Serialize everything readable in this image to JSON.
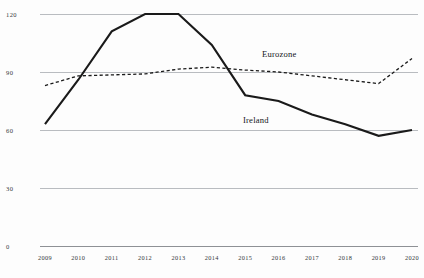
{
  "chart_data": {
    "type": "line",
    "title": "",
    "subtitle": "",
    "xlabel": "",
    "ylabel": "",
    "categories": [
      "2009",
      "2010",
      "2011",
      "2012",
      "2013",
      "2014",
      "2015",
      "2016",
      "2017",
      "2018",
      "2019",
      "2020"
    ],
    "x": [
      2009,
      2010,
      2011,
      2012,
      2013,
      2014,
      2015,
      2016,
      2017,
      2018,
      2019,
      2020
    ],
    "ylim": [
      0,
      120
    ],
    "xlim": [
      2009,
      2020
    ],
    "yticks": [
      0,
      30,
      60,
      90,
      120
    ],
    "ytick_labels": [
      "0",
      "30",
      "60",
      "90",
      "120"
    ],
    "grid": true,
    "legend": "inline-labels",
    "series": [
      {
        "name": "Ireland",
        "style": "solid",
        "color": "#1a1a1a",
        "width": 2.1,
        "values": [
          63,
          86,
          111,
          120,
          120,
          104,
          78,
          75,
          68,
          63,
          57,
          60
        ]
      },
      {
        "name": "Eurozone",
        "style": "dashed",
        "color": "#1a1a1a",
        "width": 1.3,
        "values": [
          83,
          88,
          88.5,
          89,
          91.5,
          92.5,
          91,
          90,
          88,
          86,
          84,
          97
        ]
      }
    ],
    "annotations": [
      {
        "text": "Eurozone",
        "for_series": "Eurozone"
      },
      {
        "text": "Ireland",
        "for_series": "Ireland"
      }
    ]
  },
  "axes": {
    "y_tick_labels": [
      "120",
      "90",
      "60",
      "30",
      "0"
    ],
    "x_tick_labels": [
      "2009",
      "2010",
      "2011",
      "2012",
      "2013",
      "2014",
      "2015",
      "2016",
      "2017",
      "2018",
      "2019",
      "2020"
    ]
  },
  "colors": {
    "background": "#fdfdfd",
    "grid": "#b9bcc0",
    "axis": "#8e9195",
    "ink": "#1a1a1a"
  }
}
